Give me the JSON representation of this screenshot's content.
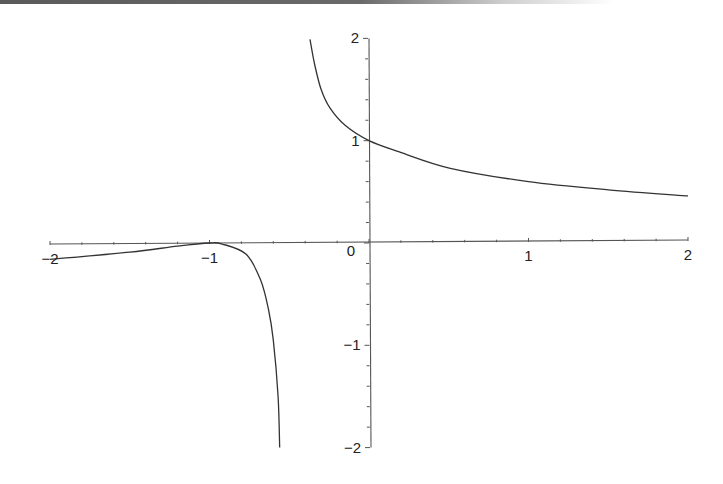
{
  "chart_data": {
    "type": "line",
    "title": "",
    "xlabel": "",
    "ylabel": "",
    "xlim": [
      -2,
      2
    ],
    "ylim": [
      -2,
      2
    ],
    "grid": false,
    "legend": null,
    "x_ticks": [
      "−2",
      "−1",
      "0",
      "1",
      "2"
    ],
    "y_ticks": [
      "2",
      "1",
      "−1",
      "−2"
    ],
    "origin_label": "0",
    "vertical_asymptote_x": -0.45,
    "series": [
      {
        "name": "left-branch",
        "points": [
          [
            -2.0,
            -0.16
          ],
          [
            -1.5,
            -0.09
          ],
          [
            -1.2,
            -0.03
          ],
          [
            -1.0,
            0.0
          ],
          [
            -0.92,
            -0.01
          ],
          [
            -0.77,
            -0.11
          ],
          [
            -0.68,
            -0.36
          ],
          [
            -0.63,
            -0.65
          ],
          [
            -0.6,
            -0.95
          ],
          [
            -0.57,
            -1.5
          ],
          [
            -0.56,
            -2.0
          ]
        ]
      },
      {
        "name": "right-branch",
        "points": [
          [
            -0.37,
            1.99
          ],
          [
            -0.34,
            1.74
          ],
          [
            -0.3,
            1.5
          ],
          [
            -0.245,
            1.32
          ],
          [
            -0.15,
            1.15
          ],
          [
            0.0,
            1.0
          ],
          [
            0.19,
            0.89
          ],
          [
            0.51,
            0.73
          ],
          [
            1.0,
            0.6
          ],
          [
            1.5,
            0.52
          ],
          [
            2.0,
            0.46
          ]
        ]
      }
    ],
    "line_color": "#333333"
  }
}
